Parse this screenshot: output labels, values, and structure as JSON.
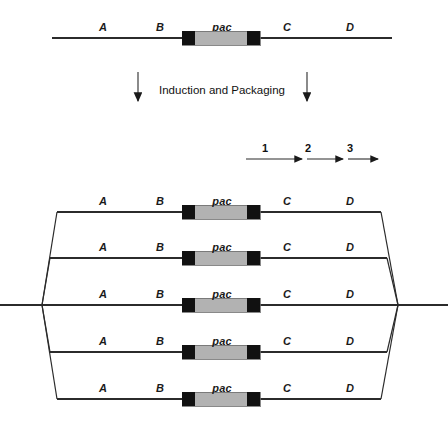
{
  "figure": {
    "type": "diagram",
    "segment_labels": [
      "A",
      "B",
      "pac",
      "C",
      "D"
    ],
    "process_label": "Induction and Packaging",
    "packaging_numbers": [
      "1",
      "2",
      "3"
    ],
    "caption": ""
  },
  "top_molecule": {
    "name": "parent-dna",
    "labels": [
      {
        "text": "A",
        "x": 103,
        "y": 21
      },
      {
        "text": "B",
        "x": 160,
        "y": 21
      },
      {
        "text": "pac",
        "x": 222,
        "y": 21
      },
      {
        "text": "C",
        "x": 287,
        "y": 21
      },
      {
        "text": "D",
        "x": 350,
        "y": 21
      }
    ],
    "line": {
      "x1": 52,
      "x2": 392,
      "y": 38
    },
    "pac_site": {
      "x": 182,
      "y": 31,
      "width": 78,
      "height": 14
    }
  },
  "arrows": {
    "left": {
      "x": 138,
      "y1": 72,
      "y2": 108
    },
    "right": {
      "x": 307,
      "y1": 72,
      "y2": 108
    },
    "label": {
      "text": "Induction and Packaging",
      "x": 222,
      "y": 84
    }
  },
  "packaging_scale": {
    "line": {
      "x1": 246,
      "x2": 383,
      "y": 159
    },
    "ticks": [
      {
        "text": "1",
        "x": 265,
        "y": 142
      },
      {
        "text": "2",
        "x": 308,
        "y": 142
      },
      {
        "text": "3",
        "x": 350,
        "y": 142
      }
    ],
    "arrowheads_x": [
      307,
      348,
      383
    ]
  },
  "concatemer": {
    "name": "packaged-headfuls",
    "rows": [
      {
        "index": 1,
        "line_y": 212,
        "label_y": 195,
        "left_x": 57,
        "right_x": 381,
        "kind": "bracket-top"
      },
      {
        "index": 2,
        "line_y": 258,
        "label_y": 241,
        "left_x": 50,
        "right_x": 387,
        "kind": "bracket-top"
      },
      {
        "index": 3,
        "line_y": 305,
        "label_y": 288,
        "left_x": 0,
        "right_x": 448,
        "kind": "through"
      },
      {
        "index": 4,
        "line_y": 352,
        "label_y": 335,
        "left_x": 50,
        "right_x": 387,
        "kind": "bracket-bottom"
      },
      {
        "index": 5,
        "line_y": 399,
        "label_y": 382,
        "left_x": 57,
        "right_x": 381,
        "kind": "bracket-bottom"
      }
    ],
    "label_x": [
      103,
      160,
      222,
      287,
      350
    ],
    "pac_site": {
      "x": 182,
      "width": 78,
      "height": 14
    },
    "converge_left": {
      "x": 42,
      "y": 305
    },
    "converge_right": {
      "x": 398,
      "y": 305
    }
  },
  "colors": {
    "line": "#2b2b2b",
    "pac_fill": "#b2b2b2",
    "pac_cap": "#111111",
    "text": "#1a1a1a"
  }
}
